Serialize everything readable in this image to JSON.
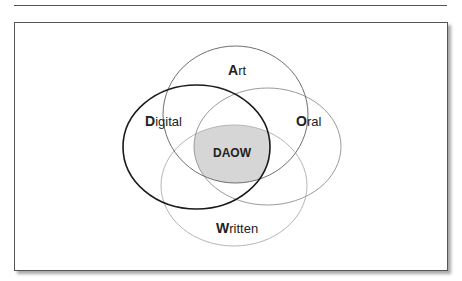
{
  "diagram": {
    "type": "venn",
    "sets": [
      {
        "id": "art",
        "initial": "A",
        "rest": "rt",
        "label": "Art",
        "stroke": "#6e6e6e",
        "stroke_width": 1
      },
      {
        "id": "digital",
        "initial": "D",
        "rest": "igital",
        "label": "Digital",
        "stroke": "#1a1a1a",
        "stroke_width": 1.6
      },
      {
        "id": "oral",
        "initial": "O",
        "rest": "ral",
        "label": "Oral",
        "stroke": "#9a9a9a",
        "stroke_width": 1
      },
      {
        "id": "written",
        "initial": "W",
        "rest": "ritten",
        "label": "Written",
        "stroke": "#b5b5b5",
        "stroke_width": 1
      }
    ],
    "intersection": {
      "label": "DAOW",
      "fill": "#d6d6d6"
    }
  }
}
